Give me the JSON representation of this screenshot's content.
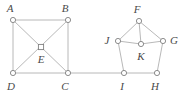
{
  "figure": {
    "width": 188,
    "height": 96,
    "background_color": "#ffffff",
    "edge_color": "#b0b0b0",
    "vertex_stroke_color": "#808080",
    "vertex_fill_color": "#ffffff",
    "label_color": "#4a4a4a",
    "edge_width": 0.9,
    "vertex_radius": 2.6
  },
  "graph": {
    "vertices": [
      {
        "id": "A",
        "label": "A",
        "x": 13,
        "y": 20,
        "label_x": 10,
        "label_y": 8,
        "marker": "circle"
      },
      {
        "id": "B",
        "label": "B",
        "x": 68,
        "y": 20,
        "label_x": 65,
        "label_y": 8,
        "marker": "circle"
      },
      {
        "id": "C",
        "label": "C",
        "x": 68,
        "y": 73,
        "label_x": 65,
        "label_y": 86,
        "marker": "circle"
      },
      {
        "id": "D",
        "label": "D",
        "x": 13,
        "y": 73,
        "label_x": 11,
        "label_y": 86,
        "marker": "circle"
      },
      {
        "id": "E",
        "label": "E",
        "x": 41,
        "y": 47,
        "label_x": 41,
        "label_y": 59,
        "marker": "square"
      },
      {
        "id": "F",
        "label": "F",
        "x": 139,
        "y": 21,
        "label_x": 137,
        "label_y": 9,
        "marker": "circle"
      },
      {
        "id": "G",
        "label": "G",
        "x": 163,
        "y": 41,
        "label_x": 174,
        "label_y": 40,
        "marker": "circle"
      },
      {
        "id": "H",
        "label": "H",
        "x": 157,
        "y": 73,
        "label_x": 155,
        "label_y": 86,
        "marker": "circle"
      },
      {
        "id": "I",
        "label": "I",
        "x": 124,
        "y": 73,
        "label_x": 122,
        "label_y": 86,
        "marker": "circle"
      },
      {
        "id": "J",
        "label": "J",
        "x": 118,
        "y": 41,
        "label_x": 107,
        "label_y": 40,
        "marker": "circle"
      },
      {
        "id": "K",
        "label": "K",
        "x": 141,
        "y": 44,
        "label_x": 141,
        "label_y": 56,
        "marker": "circle"
      }
    ],
    "edges": [
      {
        "from": "A",
        "to": "B",
        "name": "edge-A-B"
      },
      {
        "from": "A",
        "to": "D",
        "name": "edge-A-D"
      },
      {
        "from": "B",
        "to": "C",
        "name": "edge-B-C"
      },
      {
        "from": "D",
        "to": "C",
        "name": "edge-D-C"
      },
      {
        "from": "A",
        "to": "C",
        "name": "edge-A-C-diagonal"
      },
      {
        "from": "B",
        "to": "D",
        "name": "edge-B-D-diagonal"
      },
      {
        "from": "C",
        "to": "I",
        "name": "edge-C-I-bridge"
      },
      {
        "from": "F",
        "to": "J",
        "name": "edge-F-J"
      },
      {
        "from": "F",
        "to": "G",
        "name": "edge-F-G"
      },
      {
        "from": "J",
        "to": "I",
        "name": "edge-J-I"
      },
      {
        "from": "G",
        "to": "H",
        "name": "edge-G-H"
      },
      {
        "from": "I",
        "to": "H",
        "name": "edge-I-H"
      },
      {
        "from": "K",
        "to": "F",
        "name": "edge-K-F"
      },
      {
        "from": "K",
        "to": "J",
        "name": "edge-K-J"
      },
      {
        "from": "K",
        "to": "G",
        "name": "edge-K-G"
      }
    ]
  }
}
